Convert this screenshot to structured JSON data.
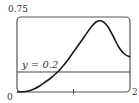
{
  "chart_data": {
    "type": "line",
    "title": "",
    "xlabel": "",
    "ylabel": "",
    "xlim": [
      0,
      2
    ],
    "ylim": [
      0,
      0.75
    ],
    "grid": false,
    "x_tick_labels": [
      "0",
      "2"
    ],
    "y_tick_labels": [
      "0.75"
    ],
    "x_ticks": [
      1
    ],
    "series": [
      {
        "name": "f(x)",
        "x": [
          0,
          0.1,
          0.2,
          0.3,
          0.4,
          0.5,
          0.6,
          0.7,
          0.8,
          0.9,
          1.0,
          1.1,
          1.2,
          1.3,
          1.4,
          1.5,
          1.6,
          1.7,
          1.8,
          1.9,
          2.0
        ],
        "values": [
          0,
          0.002,
          0.01,
          0.03,
          0.06,
          0.1,
          0.14,
          0.19,
          0.25,
          0.32,
          0.4,
          0.48,
          0.56,
          0.64,
          0.7,
          0.71,
          0.66,
          0.56,
          0.45,
          0.38,
          0.35
        ]
      },
      {
        "name": "y = 0.2",
        "x": [
          0,
          2
        ],
        "values": [
          0.2,
          0.2
        ]
      }
    ],
    "annotations": [
      {
        "text": "y = 0.2",
        "x": 0.1,
        "y": 0.23
      }
    ]
  },
  "labels": {
    "y_max": "0.75",
    "x_min": "0",
    "x_max": "2",
    "line_label": "y = 0.2"
  },
  "colors": {
    "curve": "#1a1a1a",
    "frame": "#555555",
    "text": "#333333"
  }
}
